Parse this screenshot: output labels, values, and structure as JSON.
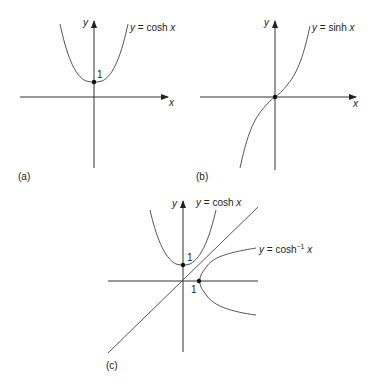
{
  "figure": {
    "panels": [
      {
        "id": "a",
        "label": "(a)",
        "x_axis_label": "x",
        "y_axis_label": "y",
        "curve_label": "y = cosh x",
        "tick_label": "1",
        "marked_point": "(0, 1)"
      },
      {
        "id": "b",
        "label": "(b)",
        "x_axis_label": "x",
        "y_axis_label": "y",
        "curve_label": "y = sinh x",
        "marked_point": "(0, 0)"
      },
      {
        "id": "c",
        "label": "(c)",
        "x_axis_label": "",
        "y_axis_label": "y",
        "curve_labels": [
          "y = cosh x",
          "y = cosh⁻¹ x"
        ],
        "tick_labels": [
          "1",
          "1"
        ],
        "marked_points": [
          "(0, 1)",
          "(1, 0)"
        ],
        "reflection_line": "y = x"
      }
    ]
  },
  "text": {
    "a_label": "(a)",
    "b_label": "(b)",
    "c_label": "(c)",
    "x": "x",
    "y": "y",
    "one": "1",
    "y_eq": "y = ",
    "cosh": "cosh",
    "sinh": "sinh",
    "cosh_inv_sup": "−1"
  }
}
